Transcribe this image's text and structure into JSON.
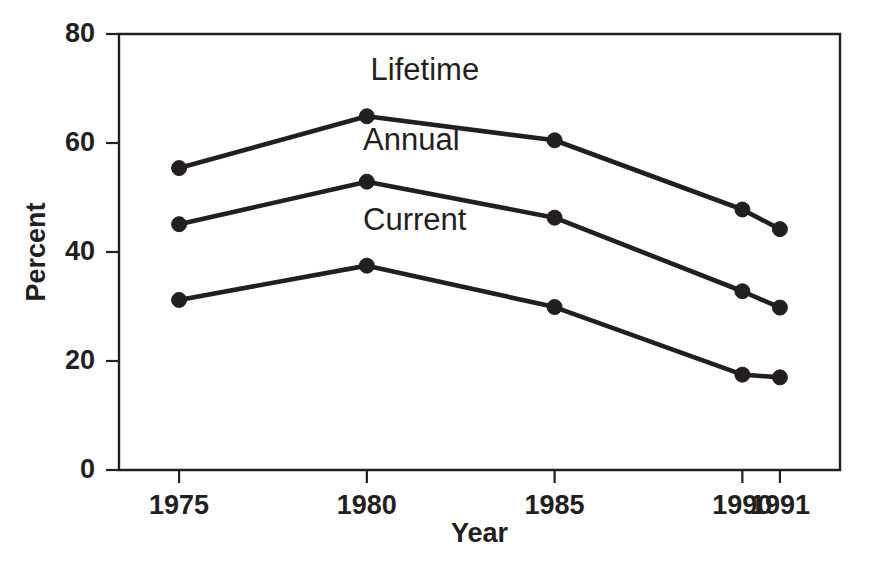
{
  "chart_data": {
    "type": "line",
    "title": "",
    "subtitle": "",
    "xlabel": "Year",
    "ylabel": "Percent",
    "x": [
      1975,
      1980,
      1985,
      1990,
      1991
    ],
    "xtick_labels": [
      "1975",
      "1980",
      "1985",
      "1990",
      "1991"
    ],
    "ytick_labels": [
      "0",
      "20",
      "40",
      "60",
      "80"
    ],
    "yticks": [
      0,
      20,
      40,
      60,
      80
    ],
    "xlim": [
      1973.4,
      1992.6
    ],
    "ylim": [
      0,
      80
    ],
    "grid": false,
    "legend_position": "inline-labels",
    "marker": "filled-circle",
    "line_color": "#231f20",
    "series": [
      {
        "name": "Lifetime",
        "label": "Lifetime",
        "values": [
          55.4,
          64.9,
          60.5,
          47.8,
          44.2
        ],
        "label_x": 1980.1,
        "label_y": 71.5
      },
      {
        "name": "Annual",
        "label": "Annual",
        "values": [
          45.1,
          52.9,
          46.3,
          32.8,
          29.8
        ],
        "label_x": 1979.9,
        "label_y": 58.8
      },
      {
        "name": "Current",
        "label": "Current",
        "values": [
          31.2,
          37.5,
          29.9,
          17.5,
          17.0
        ],
        "label_x": 1979.9,
        "label_y": 44.1
      }
    ]
  }
}
